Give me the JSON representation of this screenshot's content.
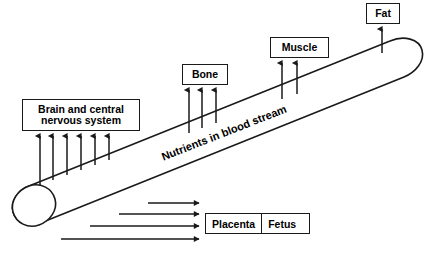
{
  "diagram": {
    "tube_label": "Nutrients in blood stream",
    "background_color": "#ffffff",
    "stroke_color": "#1a1a1a",
    "text_color": "#000000",
    "destinations": [
      {
        "id": "brain",
        "label_line1": "Brain and central",
        "label_line2": "nervous system",
        "arrow_count": 6,
        "arrow_direction": "up"
      },
      {
        "id": "bone",
        "label": "Bone",
        "arrow_count": 3,
        "arrow_direction": "up"
      },
      {
        "id": "muscle",
        "label": "Muscle",
        "arrow_count": 2,
        "arrow_direction": "up"
      },
      {
        "id": "fat",
        "label": "Fat",
        "arrow_count": 1,
        "arrow_direction": "up"
      }
    ],
    "lower_destination": {
      "id": "placenta-fetus",
      "cells": [
        "Placenta",
        "Fetus"
      ],
      "arrow_count": 4,
      "arrow_direction": "right"
    }
  }
}
